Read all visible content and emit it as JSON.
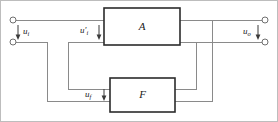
{
  "diagram": {
    "type": "block-diagram",
    "blocks": [
      {
        "id": "A",
        "label": "A",
        "role": "basic-amplifier",
        "x": 104,
        "y": 8,
        "w": 76,
        "h": 37
      },
      {
        "id": "F",
        "label": "F",
        "role": "feedback-network",
        "x": 110,
        "y": 78,
        "w": 65,
        "h": 34
      }
    ],
    "signals": [
      {
        "id": "ui",
        "base": "u",
        "sub": "i",
        "prime": false,
        "role": "input-voltage"
      },
      {
        "id": "uid",
        "base": "u",
        "sub": "i",
        "prime": true,
        "role": "net-input-voltage"
      },
      {
        "id": "uf",
        "base": "u",
        "sub": "f",
        "prime": false,
        "role": "feedback-voltage"
      },
      {
        "id": "uo",
        "base": "u",
        "sub": "o",
        "prime": false,
        "role": "output-voltage"
      }
    ],
    "labels": {
      "input_voltage": "u",
      "input_voltage_sub": "i",
      "net_input_voltage": "u",
      "net_input_voltage_sub": "i",
      "net_input_voltage_prime": "′",
      "feedback_voltage": "u",
      "feedback_voltage_sub": "f",
      "output_voltage": "u",
      "output_voltage_sub": "o",
      "block_a": "A",
      "block_f": "F"
    },
    "terminals": [
      {
        "id": "in-top",
        "x": 12,
        "y": 20
      },
      {
        "id": "in-bottom",
        "x": 12,
        "y": 42
      },
      {
        "id": "out-top",
        "x": 266,
        "y": 20
      },
      {
        "id": "out-bottom",
        "x": 266,
        "y": 42
      }
    ],
    "colors": {
      "wire": "#8a8a8a",
      "block_border": "#2b2b2b",
      "text": "#1a1a1a",
      "background": "#ffffff",
      "frame": "#bdbdbd"
    }
  }
}
